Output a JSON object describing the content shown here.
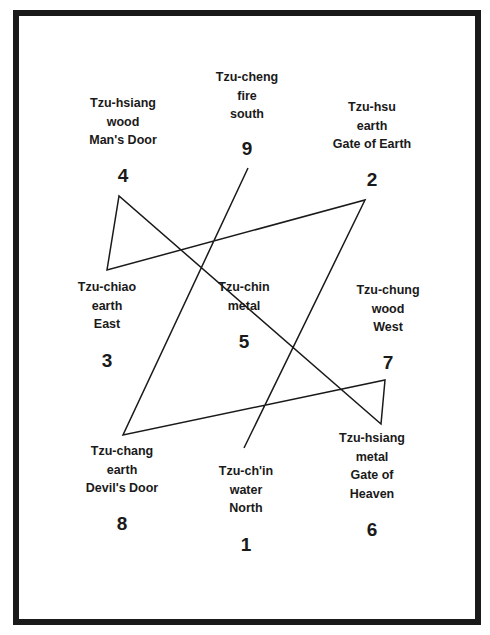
{
  "diagram": {
    "type": "lo-shu-magic-square-path",
    "sectors": [
      {
        "number": "4",
        "lines": [
          "Tzu-hsiang",
          "wood",
          "Man's Door"
        ]
      },
      {
        "number": "9",
        "lines": [
          "Tzu-cheng",
          "fire",
          "south"
        ]
      },
      {
        "number": "2",
        "lines": [
          "Tzu-hsu",
          "earth",
          "Gate of Earth"
        ]
      },
      {
        "number": "3",
        "lines": [
          "Tzu-chiao",
          "earth",
          "East"
        ]
      },
      {
        "number": "5",
        "lines": [
          "Tzu-chin",
          "metal"
        ]
      },
      {
        "number": "7",
        "lines": [
          "Tzu-chung",
          "wood",
          "West"
        ]
      },
      {
        "number": "8",
        "lines": [
          "Tzu-chang",
          "earth",
          "Devil's Door"
        ]
      },
      {
        "number": "1",
        "lines": [
          "Tzu-ch'in",
          "water",
          "North"
        ]
      },
      {
        "number": "6",
        "lines": [
          "Tzu-hsiang",
          "metal",
          "Gate of",
          "Heaven"
        ]
      }
    ],
    "path_order": [
      "1",
      "2",
      "3",
      "4",
      "5",
      "6",
      "7",
      "8",
      "9"
    ],
    "path_points": [
      [
        244,
        448
      ],
      [
        365,
        200
      ],
      [
        107,
        270
      ],
      [
        119,
        196
      ],
      [
        381,
        424
      ],
      [
        385,
        380
      ],
      [
        123,
        435
      ],
      [
        248,
        168
      ]
    ],
    "stroke_color": "#1a1a1a"
  }
}
